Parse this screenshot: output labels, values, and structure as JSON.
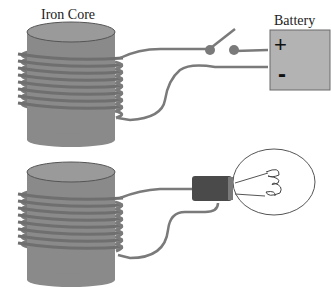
{
  "diagram": {
    "labels": {
      "iron_core": "Iron Core",
      "battery": "Battery",
      "positive": "+",
      "negative": "-"
    },
    "components": [
      {
        "name": "upper-electromagnet",
        "parts": [
          "iron-core-cylinder",
          "wire-coil"
        ]
      },
      {
        "name": "switch",
        "state": "open"
      },
      {
        "name": "battery",
        "terminals": [
          "+",
          "-"
        ]
      },
      {
        "name": "lower-electromagnet",
        "parts": [
          "iron-core-cylinder",
          "wire-coil"
        ]
      },
      {
        "name": "light-bulb",
        "state": "off"
      }
    ],
    "colors": {
      "core": "#8a8a8a",
      "core_top": "#9a9a9a",
      "wire": "#7a7a7a",
      "battery": "#b3b3b3",
      "bulb_base": "#4a4a4a",
      "bulb_outline": "#555555"
    }
  }
}
